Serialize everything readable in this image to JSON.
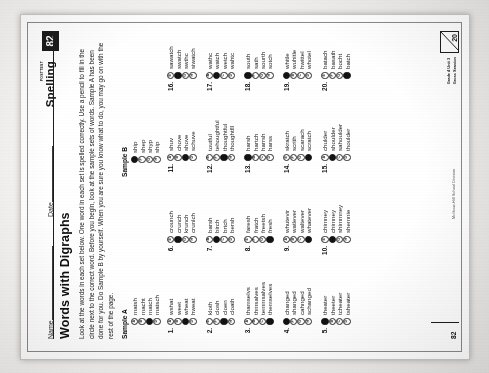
{
  "document": {
    "kind": "spelling-worksheet-scan",
    "rotation_degrees": -90,
    "header": {
      "name_label": "Name",
      "date_label": "Date",
      "posttest_label": "POSTTEST",
      "subject_label": "Spelling",
      "page_badge": "82"
    },
    "title": "Words with Digraphs",
    "instructions": "Look at the words in each set below. One word in each set is spelled correctly. Use a pencil to fill in the circle next to the correct word. Before you begin, look at the sample sets of words. Sample A has been done for you. Do Sample B by yourself. When you are sure you know what to do, you may go on with the rest of the page.",
    "footer": {
      "page_number": "82",
      "credit": "McGraw-Hill School Division",
      "grade_line1": "Grade 4 Unit 3",
      "grade_line2": "Gross Seasion",
      "score_total": "20"
    }
  },
  "samples": [
    {
      "label": "Sample A",
      "options": [
        {
          "letter": "A",
          "word": "matsh",
          "filled": false
        },
        {
          "letter": "B",
          "word": "macht",
          "filled": false
        },
        {
          "letter": "C",
          "word": "match",
          "filled": true
        },
        {
          "letter": "D",
          "word": "matsch",
          "filled": false
        }
      ]
    },
    {
      "label": "Sample B",
      "options": [
        {
          "letter": "E",
          "word": "ship",
          "filled": true
        },
        {
          "letter": "F",
          "word": "shep",
          "filled": false
        },
        {
          "letter": "G",
          "word": "shyp",
          "filled": false
        },
        {
          "letter": "H",
          "word": "ship",
          "filled": false
        }
      ]
    }
  ],
  "questions": [
    {
      "number": "1.",
      "options": [
        {
          "letter": "A",
          "word": "wshat",
          "filled": false
        },
        {
          "letter": "B",
          "word": "weet",
          "filled": false
        },
        {
          "letter": "C",
          "word": "wheat",
          "filled": true
        },
        {
          "letter": "D",
          "word": "hweat",
          "filled": false
        }
      ]
    },
    {
      "number": "2.",
      "options": [
        {
          "letter": "E",
          "word": "kloth",
          "filled": false
        },
        {
          "letter": "F",
          "word": "closh",
          "filled": false
        },
        {
          "letter": "G",
          "word": "cloen",
          "filled": true
        },
        {
          "letter": "H",
          "word": "cloath",
          "filled": false
        }
      ]
    },
    {
      "number": "3.",
      "options": [
        {
          "letter": "A",
          "word": "thamselvs",
          "filled": false
        },
        {
          "letter": "B",
          "word": "thmsalves",
          "filled": false
        },
        {
          "letter": "C",
          "word": "temmsalves",
          "filled": false
        },
        {
          "letter": "D",
          "word": "themselves",
          "filled": true
        }
      ]
    },
    {
      "number": "4.",
      "options": [
        {
          "letter": "E",
          "word": "changed",
          "filled": true
        },
        {
          "letter": "F",
          "word": "shanged",
          "filled": false
        },
        {
          "letter": "G",
          "word": "cahnged",
          "filled": false
        },
        {
          "letter": "H",
          "word": "schanged",
          "filled": false
        }
      ]
    },
    {
      "number": "5.",
      "options": [
        {
          "letter": "A",
          "word": "theater",
          "filled": true
        },
        {
          "letter": "B",
          "word": "theeter",
          "filled": false
        },
        {
          "letter": "C",
          "word": "tcheater",
          "filled": false
        },
        {
          "letter": "D",
          "word": "tsheater",
          "filled": false
        }
      ]
    },
    {
      "number": "6.",
      "options": [
        {
          "letter": "E",
          "word": "crounch",
          "filled": false
        },
        {
          "letter": "F",
          "word": "crunch",
          "filled": true
        },
        {
          "letter": "G",
          "word": "krunch",
          "filled": false
        },
        {
          "letter": "H",
          "word": "crunlch",
          "filled": false
        }
      ]
    },
    {
      "number": "7.",
      "options": [
        {
          "letter": "A",
          "word": "barsh",
          "filled": false
        },
        {
          "letter": "B",
          "word": "birch",
          "filled": true
        },
        {
          "letter": "C",
          "word": "brtch",
          "filled": false
        },
        {
          "letter": "D",
          "word": "bersh",
          "filled": false
        }
      ]
    },
    {
      "number": "8.",
      "options": [
        {
          "letter": "E",
          "word": "faresh",
          "filled": false
        },
        {
          "letter": "F",
          "word": "fratch",
          "filled": false
        },
        {
          "letter": "G",
          "word": "freetsh",
          "filled": false
        },
        {
          "letter": "H",
          "word": "fresh",
          "filled": true
        }
      ]
    },
    {
      "number": "9.",
      "options": [
        {
          "letter": "A",
          "word": "whutevir",
          "filled": false
        },
        {
          "letter": "B",
          "word": "watlever",
          "filled": false
        },
        {
          "letter": "C",
          "word": "waltever",
          "filled": false
        },
        {
          "letter": "D",
          "word": "whatever",
          "filled": true
        }
      ]
    },
    {
      "number": "10.",
      "options": [
        {
          "letter": "E",
          "word": "chimney",
          "filled": false
        },
        {
          "letter": "F",
          "word": "chimney",
          "filled": true
        },
        {
          "letter": "G",
          "word": "shimmney",
          "filled": false
        },
        {
          "letter": "H",
          "word": "shemnie",
          "filled": false
        }
      ]
    },
    {
      "number": "11.",
      "options": [
        {
          "letter": "A",
          "word": "shuv",
          "filled": false
        },
        {
          "letter": "B",
          "word": "chove",
          "filled": false
        },
        {
          "letter": "C",
          "word": "shove",
          "filled": true
        },
        {
          "letter": "D",
          "word": "schuve",
          "filled": false
        }
      ]
    },
    {
      "number": "12.",
      "options": [
        {
          "letter": "E",
          "word": "toutful",
          "filled": false
        },
        {
          "letter": "F",
          "word": "tehoughtful",
          "filled": false
        },
        {
          "letter": "G",
          "word": "thoughtful",
          "filled": true
        },
        {
          "letter": "H",
          "word": "thoughtfll",
          "filled": false
        }
      ]
    },
    {
      "number": "13.",
      "options": [
        {
          "letter": "A",
          "word": "harsh",
          "filled": true
        },
        {
          "letter": "B",
          "word": "hartch",
          "filled": false
        },
        {
          "letter": "C",
          "word": "harrsh",
          "filled": false
        },
        {
          "letter": "D",
          "word": "harss",
          "filled": false
        }
      ]
    },
    {
      "number": "14.",
      "options": [
        {
          "letter": "E",
          "word": "skratch",
          "filled": false
        },
        {
          "letter": "F",
          "word": "scrith",
          "filled": false
        },
        {
          "letter": "G",
          "word": "scarach",
          "filled": false
        },
        {
          "letter": "H",
          "word": "scratch",
          "filled": true
        }
      ]
    },
    {
      "number": "15.",
      "options": [
        {
          "letter": "A",
          "word": "chulder",
          "filled": false
        },
        {
          "letter": "B",
          "word": "shoulder",
          "filled": true
        },
        {
          "letter": "C",
          "word": "sahoulder",
          "filled": false
        },
        {
          "letter": "D",
          "word": "thoulder",
          "filled": false
        }
      ]
    },
    {
      "number": "16.",
      "options": [
        {
          "letter": "E",
          "word": "sawatch",
          "filled": false
        },
        {
          "letter": "F",
          "word": "swatch",
          "filled": true
        },
        {
          "letter": "G",
          "word": "swthc",
          "filled": false
        },
        {
          "letter": "H",
          "word": "siwatch",
          "filled": false
        }
      ]
    },
    {
      "number": "17.",
      "options": [
        {
          "letter": "A",
          "word": "wathc",
          "filled": false
        },
        {
          "letter": "B",
          "word": "watch",
          "filled": true
        },
        {
          "letter": "C",
          "word": "wetch",
          "filled": false
        },
        {
          "letter": "D",
          "word": "wahtc",
          "filled": false
        }
      ]
    },
    {
      "number": "18.",
      "options": [
        {
          "letter": "E",
          "word": "south",
          "filled": true
        },
        {
          "letter": "F",
          "word": "sath",
          "filled": false
        },
        {
          "letter": "G",
          "word": "sourth",
          "filled": false
        },
        {
          "letter": "H",
          "word": "sotch",
          "filled": false
        }
      ]
    },
    {
      "number": "19.",
      "options": [
        {
          "letter": "A",
          "word": "whitle",
          "filled": true
        },
        {
          "letter": "B",
          "word": "wuhitle",
          "filled": false
        },
        {
          "letter": "C",
          "word": "hwittel",
          "filled": false
        },
        {
          "letter": "D",
          "word": "whotel",
          "filled": false
        }
      ]
    },
    {
      "number": "20.",
      "options": [
        {
          "letter": "E",
          "word": "batach",
          "filled": false
        },
        {
          "letter": "F",
          "word": "basath",
          "filled": false
        },
        {
          "letter": "G",
          "word": "bocht",
          "filled": false
        },
        {
          "letter": "H",
          "word": "batch",
          "filled": true
        }
      ]
    }
  ]
}
